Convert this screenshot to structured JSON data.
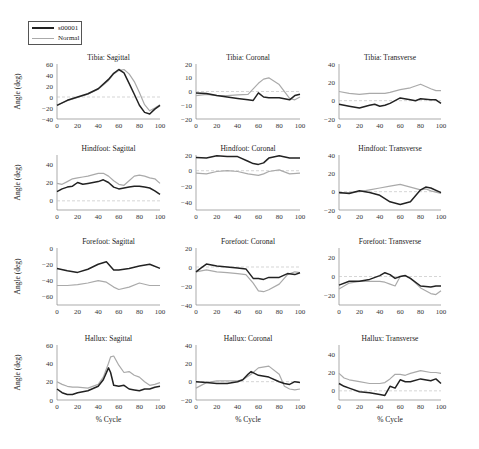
{
  "legend": {
    "items": [
      {
        "label": "s00001",
        "color": "#222222",
        "width": 1.6
      },
      {
        "label": "Normal",
        "color": "#aaaaaa",
        "width": 1.2
      }
    ]
  },
  "ylabel": "Angle (deg)",
  "xlabel": "% Cycle",
  "colors": {
    "subject": "#222222",
    "normal": "#aaaaaa",
    "zero_line": "#bbbbbb",
    "axis": "#888888"
  },
  "chart_data": [
    {
      "type": "line",
      "title": "Tibia: Sagittal",
      "ylim": [
        -40,
        60
      ],
      "yticks": [
        -40,
        -20,
        0,
        20,
        40,
        60
      ],
      "xticks": [
        0,
        20,
        40,
        60,
        80,
        100
      ],
      "x": [
        0,
        10,
        20,
        30,
        40,
        50,
        55,
        60,
        65,
        70,
        75,
        80,
        85,
        90,
        95,
        100
      ],
      "series": [
        {
          "name": "s00001",
          "values": [
            -15,
            -6,
            0,
            6,
            15,
            32,
            43,
            50,
            44,
            25,
            5,
            -15,
            -28,
            -31,
            -22,
            -15
          ]
        },
        {
          "name": "Normal",
          "values": [
            -15,
            -7,
            -1,
            5,
            14,
            30,
            42,
            48,
            50,
            42,
            28,
            8,
            -14,
            -25,
            -20,
            -14
          ]
        }
      ]
    },
    {
      "type": "line",
      "title": "Tibia: Coronal",
      "ylim": [
        -20,
        20
      ],
      "yticks": [
        -20,
        -10,
        0,
        10,
        20
      ],
      "xticks": [
        0,
        20,
        40,
        60,
        80,
        100
      ],
      "x": [
        0,
        10,
        20,
        30,
        40,
        50,
        55,
        60,
        65,
        70,
        80,
        90,
        95,
        100
      ],
      "series": [
        {
          "name": "s00001",
          "values": [
            -1,
            -1.5,
            -3,
            -4,
            -5,
            -6,
            -6.5,
            -1,
            -4,
            -4.5,
            -4.5,
            -6,
            -3,
            -2
          ]
        },
        {
          "name": "Normal",
          "values": [
            -3,
            -2,
            -3,
            -3,
            -2.5,
            -2,
            2,
            6,
            9,
            10,
            5,
            -5,
            -6,
            -4
          ]
        }
      ]
    },
    {
      "type": "line",
      "title": "Tibia: Transverse",
      "ylim": [
        -20,
        40
      ],
      "yticks": [
        -20,
        0,
        20,
        40
      ],
      "xticks": [
        0,
        20,
        40,
        60,
        80,
        100
      ],
      "x": [
        0,
        10,
        20,
        30,
        35,
        40,
        45,
        50,
        60,
        70,
        75,
        80,
        90,
        95,
        100
      ],
      "series": [
        {
          "name": "s00001",
          "values": [
            -4,
            -6,
            -8,
            -5,
            -4,
            -6,
            -5,
            -3,
            3,
            1,
            0,
            2,
            1,
            1,
            -3
          ]
        },
        {
          "name": "Normal",
          "values": [
            10,
            8,
            7,
            8,
            8,
            8,
            8,
            9,
            12,
            14,
            16,
            18,
            13,
            11,
            11
          ]
        }
      ]
    },
    {
      "type": "line",
      "title": "Hindfoot: Sagittal",
      "ylim": [
        -10,
        50
      ],
      "yticks": [
        0,
        20,
        40
      ],
      "xticks": [
        0,
        20,
        40,
        60,
        80,
        100
      ],
      "x": [
        0,
        5,
        10,
        15,
        20,
        25,
        30,
        40,
        45,
        50,
        55,
        60,
        65,
        70,
        75,
        80,
        85,
        90,
        95,
        100
      ],
      "series": [
        {
          "name": "s00001",
          "values": [
            10,
            13,
            15,
            16,
            20,
            18,
            19,
            21,
            23,
            20,
            15,
            13,
            14,
            15,
            16,
            16,
            15,
            14,
            11,
            7
          ]
        },
        {
          "name": "Normal",
          "values": [
            19,
            18,
            21,
            24,
            25,
            26,
            27,
            30,
            30,
            27,
            22,
            18,
            17,
            22,
            27,
            28,
            27,
            25,
            24,
            19
          ]
        }
      ]
    },
    {
      "type": "line",
      "title": "Hindfoot: Coronal",
      "ylim": [
        -50,
        20
      ],
      "yticks": [
        -40,
        -20,
        0,
        20
      ],
      "xticks": [
        0,
        20,
        40,
        60,
        80,
        100
      ],
      "x": [
        0,
        10,
        20,
        30,
        40,
        50,
        55,
        60,
        65,
        70,
        80,
        90,
        100
      ],
      "series": [
        {
          "name": "s00001",
          "values": [
            17,
            16,
            19,
            18,
            18,
            12,
            9,
            8,
            10,
            16,
            19,
            16,
            16
          ]
        },
        {
          "name": "Normal",
          "values": [
            -3,
            -4,
            -1,
            0,
            -1,
            -4,
            -5,
            -6,
            -4,
            -1,
            1,
            -4,
            -3
          ]
        }
      ]
    },
    {
      "type": "line",
      "title": "Hindfoot: Transverse",
      "ylim": [
        -20,
        40
      ],
      "yticks": [
        -20,
        0,
        20,
        40
      ],
      "xticks": [
        0,
        20,
        40,
        60,
        80,
        100
      ],
      "x": [
        0,
        10,
        20,
        30,
        40,
        50,
        60,
        70,
        80,
        85,
        90,
        100
      ],
      "series": [
        {
          "name": "s00001",
          "values": [
            -1,
            -2,
            1,
            -1,
            -4,
            -11,
            -14,
            -11,
            2,
            5,
            4,
            -1
          ]
        },
        {
          "name": "Normal",
          "values": [
            -2,
            -1,
            0,
            2,
            4,
            6,
            8,
            5,
            2,
            3,
            1,
            -2
          ]
        }
      ]
    },
    {
      "type": "line",
      "title": "Forefoot: Sagittal",
      "ylim": [
        -70,
        0
      ],
      "yticks": [
        -60,
        -40,
        -20,
        0
      ],
      "xticks": [
        0,
        20,
        40,
        60,
        80,
        100
      ],
      "x": [
        0,
        10,
        20,
        30,
        40,
        48,
        55,
        60,
        70,
        80,
        90,
        100
      ],
      "series": [
        {
          "name": "s00001",
          "values": [
            -25,
            -28,
            -30,
            -26,
            -20,
            -17,
            -27,
            -27,
            -25,
            -22,
            -20,
            -25
          ]
        },
        {
          "name": "Normal",
          "values": [
            -46,
            -46,
            -45,
            -43,
            -40,
            -42,
            -48,
            -51,
            -48,
            -43,
            -46,
            -46
          ]
        }
      ]
    },
    {
      "type": "line",
      "title": "Forefoot: Coronal",
      "ylim": [
        -40,
        20
      ],
      "yticks": [
        -40,
        -20,
        0,
        20
      ],
      "xticks": [
        0,
        20,
        40,
        60,
        80,
        100
      ],
      "x": [
        0,
        5,
        10,
        20,
        30,
        40,
        48,
        55,
        60,
        65,
        70,
        80,
        88,
        95,
        100
      ],
      "series": [
        {
          "name": "s00001",
          "values": [
            -5,
            -1,
            3,
            1,
            0,
            -1,
            -2,
            -12,
            -12,
            -13,
            -11,
            -11,
            -7,
            -8,
            -6
          ]
        },
        {
          "name": "Normal",
          "values": [
            -5,
            -4,
            -3,
            -5,
            -6,
            -7,
            -8,
            -17,
            -25,
            -26,
            -24,
            -18,
            -8,
            -5,
            -6
          ]
        }
      ]
    },
    {
      "type": "line",
      "title": "Forefoot: Transverse",
      "ylim": [
        -30,
        30
      ],
      "yticks": [
        -20,
        0,
        20
      ],
      "xticks": [
        0,
        20,
        40,
        60,
        80,
        100
      ],
      "x": [
        0,
        10,
        20,
        30,
        40,
        45,
        50,
        55,
        60,
        65,
        70,
        80,
        90,
        95,
        100
      ],
      "series": [
        {
          "name": "s00001",
          "values": [
            -9,
            -5,
            -5,
            -3,
            1,
            4,
            2,
            -2,
            0,
            1,
            -2,
            -10,
            -11,
            -10,
            -10
          ]
        },
        {
          "name": "Normal",
          "values": [
            -13,
            -7,
            -5,
            -5,
            -5,
            -6,
            -8,
            -10,
            0,
            1,
            -2,
            -12,
            -18,
            -19,
            -15
          ]
        }
      ]
    },
    {
      "type": "line",
      "title": "Hallux: Sagittal",
      "ylim": [
        0,
        60
      ],
      "yticks": [
        0,
        20,
        40,
        60
      ],
      "xticks": [
        0,
        20,
        40,
        60,
        80,
        100
      ],
      "x": [
        0,
        5,
        10,
        15,
        20,
        30,
        40,
        45,
        50,
        52,
        55,
        60,
        65,
        70,
        75,
        80,
        85,
        90,
        95,
        100
      ],
      "series": [
        {
          "name": "s00001",
          "values": [
            12,
            8,
            6,
            6,
            8,
            10,
            15,
            22,
            35,
            30,
            16,
            15,
            16,
            12,
            11,
            10,
            12,
            12,
            14,
            15
          ]
        },
        {
          "name": "Normal",
          "values": [
            20,
            17,
            15,
            14,
            14,
            13,
            17,
            25,
            40,
            47,
            48,
            38,
            30,
            31,
            27,
            25,
            20,
            16,
            17,
            19
          ]
        }
      ]
    },
    {
      "type": "line",
      "title": "Hallux: Coronal",
      "ylim": [
        -20,
        40
      ],
      "yticks": [
        -20,
        0,
        20,
        40
      ],
      "xticks": [
        0,
        20,
        40,
        60,
        80,
        100
      ],
      "x": [
        0,
        10,
        20,
        30,
        40,
        45,
        50,
        53,
        60,
        70,
        80,
        85,
        90,
        95,
        100
      ],
      "series": [
        {
          "name": "s00001",
          "values": [
            0,
            -1,
            -2,
            -2,
            0,
            2,
            8,
            11,
            7,
            5,
            0,
            -2,
            -3,
            0,
            -1
          ]
        },
        {
          "name": "Normal",
          "values": [
            -7,
            -1,
            1,
            1,
            1,
            2,
            6,
            8,
            15,
            17,
            8,
            -5,
            -8,
            -9,
            -8
          ]
        }
      ]
    },
    {
      "type": "line",
      "title": "Hallux: Transverse",
      "ylim": [
        -10,
        50
      ],
      "yticks": [
        0,
        20,
        40
      ],
      "xticks": [
        0,
        20,
        40,
        60,
        80,
        100
      ],
      "x": [
        0,
        5,
        10,
        20,
        30,
        40,
        45,
        50,
        55,
        60,
        65,
        70,
        80,
        90,
        95,
        100
      ],
      "series": [
        {
          "name": "s00001",
          "values": [
            8,
            5,
            3,
            -1,
            -2,
            -4,
            -5,
            5,
            3,
            12,
            10,
            10,
            13,
            11,
            13,
            8
          ]
        },
        {
          "name": "Normal",
          "values": [
            19,
            14,
            12,
            10,
            8,
            8,
            9,
            13,
            18,
            18,
            17,
            19,
            22,
            20,
            20,
            19
          ]
        }
      ]
    }
  ]
}
